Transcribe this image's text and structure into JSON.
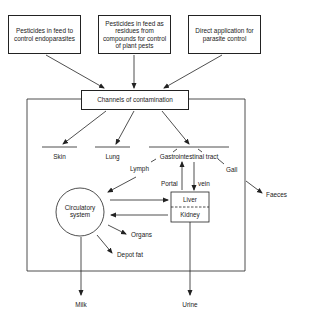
{
  "sources": [
    {
      "label": "Pesticides in feed to control endoparasites"
    },
    {
      "label": "Pesticides in feed as residues from compounds for control of plant pests"
    },
    {
      "label": "Direct application for parasite control"
    }
  ],
  "channels": {
    "label": "Channels of contamination"
  },
  "routes": {
    "skin": "Skin",
    "lung": "Lung",
    "gi": "Gastrointestinal tract"
  },
  "pathways": {
    "lymph": "Lymph",
    "portal": "Portal",
    "vein": "vein",
    "gall": "Gall",
    "faeces": "Faeces"
  },
  "circulatory": {
    "label": "Circulatory system"
  },
  "liver_kidney": {
    "liver": "Liver",
    "kidney": "Kidney"
  },
  "storage": {
    "organs": "Organs",
    "depot_fat": "Depot fat"
  },
  "outputs": {
    "milk": "Milk",
    "urine": "Urine"
  }
}
